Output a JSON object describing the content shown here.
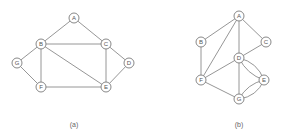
{
  "figure": {
    "graphs": [
      {
        "id": "a",
        "caption": "(a)",
        "caption_pos": [
          74,
          124
        ],
        "nodes": [
          {
            "label": "A",
            "x": 74,
            "y": 18
          },
          {
            "label": "B",
            "x": 41,
            "y": 44
          },
          {
            "label": "C",
            "x": 106,
            "y": 44
          },
          {
            "label": "D",
            "x": 129,
            "y": 63
          },
          {
            "label": "G",
            "x": 17,
            "y": 63
          },
          {
            "label": "F",
            "x": 41,
            "y": 87
          },
          {
            "label": "E",
            "x": 106,
            "y": 87
          }
        ],
        "edges": [
          [
            "A",
            "B"
          ],
          [
            "A",
            "C"
          ],
          [
            "B",
            "C"
          ],
          [
            "B",
            "G"
          ],
          [
            "B",
            "F"
          ],
          [
            "B",
            "E"
          ],
          [
            "C",
            "D"
          ],
          [
            "C",
            "E"
          ],
          [
            "D",
            "E"
          ],
          [
            "G",
            "F"
          ],
          [
            "F",
            "E"
          ]
        ],
        "curved_edges": []
      },
      {
        "id": "b",
        "caption": "(b)",
        "caption_pos": [
          239,
          124
        ],
        "nodes": [
          {
            "label": "A",
            "x": 239,
            "y": 16
          },
          {
            "label": "B",
            "x": 201,
            "y": 42
          },
          {
            "label": "C",
            "x": 266,
            "y": 42
          },
          {
            "label": "D",
            "x": 239,
            "y": 58
          },
          {
            "label": "E",
            "x": 264,
            "y": 80
          },
          {
            "label": "F",
            "x": 201,
            "y": 80
          },
          {
            "label": "G",
            "x": 239,
            "y": 99
          }
        ],
        "edges": [
          [
            "A",
            "B"
          ],
          [
            "A",
            "C"
          ],
          [
            "A",
            "D"
          ],
          [
            "A",
            "F"
          ],
          [
            "B",
            "F"
          ],
          [
            "C",
            "D"
          ],
          [
            "D",
            "F"
          ],
          [
            "D",
            "G"
          ],
          [
            "F",
            "G"
          ]
        ],
        "curved_edges": [
          {
            "from": "D",
            "to": "E",
            "bend": "inner"
          },
          {
            "from": "D",
            "to": "E",
            "bend": "outer"
          },
          {
            "from": "G",
            "to": "E",
            "bend": "inner"
          },
          {
            "from": "G",
            "to": "E",
            "bend": "outer"
          }
        ]
      }
    ]
  }
}
